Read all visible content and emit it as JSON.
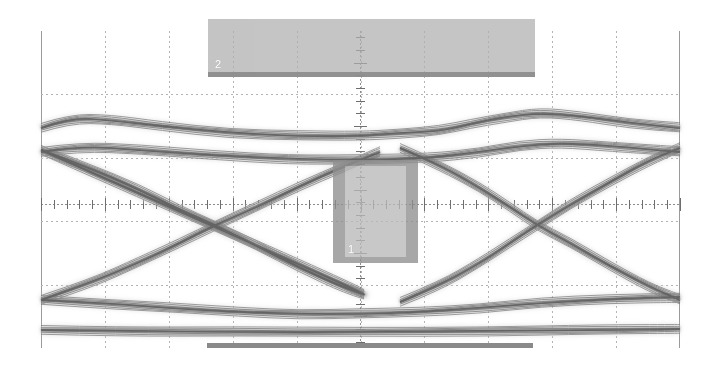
{
  "instrument": {
    "type": "oscilloscope-eye-diagram",
    "screen_width": 715,
    "screen_height": 368
  },
  "graticule": {
    "left": 41,
    "top": 31,
    "width": 639,
    "height": 317,
    "horizontal_divisions": 10,
    "vertical_divisions": 5,
    "div_width_px": 63.9,
    "div_height_px": 63.4,
    "border_color": "#9a9a9a",
    "grid_color": "#b4b4b4",
    "axis_color": "#8c8c8c",
    "background": "#ffffff"
  },
  "channels": [
    {
      "id": "1",
      "label": "1",
      "marker_kind": "measurement-gate-box",
      "label_color": "#ffffff",
      "fill_color": "#b9b9b9",
      "edge_color": "#8f8f8f",
      "box": {
        "x": 333,
        "y": 160,
        "w": 85,
        "h": 103
      }
    },
    {
      "id": "2",
      "label": "2",
      "marker_kind": "measurement-gate-box",
      "label_color": "#ffffff",
      "fill_color": "#aeaeae",
      "edge_color": "#8b8b8b",
      "box": {
        "x": 208,
        "y": 19,
        "w": 327,
        "h": 58
      }
    }
  ],
  "markers": {
    "bottom_bar": {
      "name": "bottom-gate-bar",
      "x": 207,
      "y": 343,
      "w": 326,
      "h": 5,
      "color": "#8a8a8a"
    }
  },
  "chart_data": {
    "type": "line",
    "title": "",
    "subtitle": "",
    "xlabel": "",
    "ylabel": "",
    "grid": true,
    "legend": "none",
    "xlim": [
      0,
      10
    ],
    "ylim": [
      -2.5,
      2.5
    ],
    "annotations": [
      {
        "name": "eye-crossing-left",
        "x_px": 215,
        "y_px": 225
      },
      {
        "name": "eye-crossing-right",
        "x_px": 537,
        "y_px": 225
      },
      {
        "name": "eye-opening-center",
        "x_px": 376,
        "y_px": 205
      }
    ],
    "series": [
      {
        "name": "upper-rail",
        "role": "logic-high-level",
        "y_px_nominal": 120,
        "points_px": [
          [
            41,
            128
          ],
          [
            70,
            118
          ],
          [
            110,
            120
          ],
          [
            160,
            126
          ],
          [
            230,
            133
          ],
          [
            300,
            136
          ],
          [
            360,
            136
          ],
          [
            400,
            133
          ],
          [
            440,
            131
          ],
          [
            470,
            124
          ],
          [
            505,
            117
          ],
          [
            540,
            113
          ],
          [
            580,
            116
          ],
          [
            630,
            123
          ],
          [
            680,
            128
          ]
        ]
      },
      {
        "name": "upper-rail-lower-edge",
        "role": "logic-high-level-band",
        "y_px_nominal": 146,
        "points_px": [
          [
            41,
            152
          ],
          [
            80,
            146
          ],
          [
            140,
            150
          ],
          [
            210,
            155
          ],
          [
            290,
            159
          ],
          [
            360,
            160
          ],
          [
            430,
            158
          ],
          [
            480,
            152
          ],
          [
            520,
            146
          ],
          [
            560,
            143
          ],
          [
            610,
            146
          ],
          [
            680,
            152
          ]
        ]
      },
      {
        "name": "falling-edge-left",
        "role": "transition",
        "points_px": [
          [
            41,
            150
          ],
          [
            90,
            168
          ],
          [
            140,
            190
          ],
          [
            180,
            210
          ],
          [
            215,
            225
          ],
          [
            255,
            245
          ],
          [
            300,
            268
          ],
          [
            345,
            288
          ],
          [
            380,
            300
          ],
          [
            41,
            150
          ]
        ]
      },
      {
        "name": "rising-edge-left",
        "role": "transition",
        "points_px": [
          [
            41,
            300
          ],
          [
            90,
            283
          ],
          [
            140,
            262
          ],
          [
            180,
            243
          ],
          [
            215,
            225
          ],
          [
            255,
            208
          ],
          [
            300,
            186
          ],
          [
            345,
            166
          ],
          [
            380,
            152
          ]
        ]
      },
      {
        "name": "falling-edge-right",
        "role": "transition",
        "points_px": [
          [
            400,
            148
          ],
          [
            440,
            165
          ],
          [
            480,
            188
          ],
          [
            510,
            207
          ],
          [
            537,
            225
          ],
          [
            570,
            243
          ],
          [
            610,
            266
          ],
          [
            650,
            287
          ],
          [
            680,
            300
          ]
        ]
      },
      {
        "name": "rising-edge-right",
        "role": "transition",
        "points_px": [
          [
            400,
            302
          ],
          [
            440,
            285
          ],
          [
            480,
            263
          ],
          [
            510,
            243
          ],
          [
            537,
            225
          ],
          [
            570,
            205
          ],
          [
            610,
            182
          ],
          [
            650,
            160
          ],
          [
            680,
            148
          ]
        ]
      },
      {
        "name": "lower-rail",
        "role": "logic-low-level",
        "y_px_nominal": 300,
        "points_px": [
          [
            41,
            300
          ],
          [
            100,
            303
          ],
          [
            170,
            308
          ],
          [
            240,
            312
          ],
          [
            300,
            314
          ],
          [
            360,
            314
          ],
          [
            420,
            312
          ],
          [
            480,
            308
          ],
          [
            540,
            303
          ],
          [
            610,
            299
          ],
          [
            680,
            297
          ]
        ]
      },
      {
        "name": "baseline-trace",
        "role": "dc-reference-trace",
        "y_px_nominal": 330,
        "points_px": [
          [
            41,
            330
          ],
          [
            120,
            331
          ],
          [
            240,
            332
          ],
          [
            360,
            332
          ],
          [
            480,
            331
          ],
          [
            600,
            330
          ],
          [
            680,
            329
          ]
        ]
      }
    ]
  },
  "colors": {
    "trace_dark": "#6f6f6f",
    "trace_mid": "#9d9d9d",
    "trace_light": "#cfcfcf",
    "background": "#ffffff"
  }
}
